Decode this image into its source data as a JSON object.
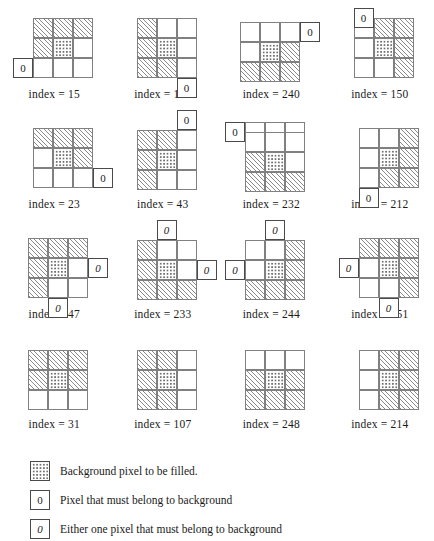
{
  "figure": {
    "rows": 4,
    "cols": 4,
    "cell_size_px": 20,
    "grid_size": 3
  },
  "patterns": [
    {
      "index_label": "index = 15",
      "grid_left": 33,
      "grid_top": 18,
      "hatch": [
        [
          1,
          1,
          1
        ],
        [
          1,
          0,
          0
        ],
        [
          0,
          0,
          0
        ]
      ],
      "dots": [
        [
          0,
          0,
          0
        ],
        [
          0,
          1,
          0
        ],
        [
          0,
          0,
          0
        ]
      ],
      "zeros": [
        {
          "left": 13,
          "top": 58,
          "text": "0",
          "italic": false
        }
      ],
      "extra_cells": [
        {
          "left": 13,
          "top": 58
        },
        {
          "left": 33,
          "top": 58
        },
        {
          "left": 53,
          "top": 58
        },
        {
          "left": 73,
          "top": 58
        }
      ]
    },
    {
      "index_label": "index = 105",
      "grid_left": 28,
      "grid_top": 18,
      "hatch": [
        [
          1,
          0,
          0
        ],
        [
          1,
          0,
          0
        ],
        [
          1,
          1,
          0
        ]
      ],
      "dots": [
        [
          0,
          0,
          0
        ],
        [
          0,
          1,
          0
        ],
        [
          0,
          0,
          0
        ]
      ],
      "zeros": [
        {
          "left": 68,
          "top": 78,
          "text": "0",
          "italic": false
        }
      ],
      "extra_cells": [
        {
          "left": 68,
          "top": 78
        },
        {
          "left": 68,
          "top": 58
        }
      ]
    },
    {
      "index_label": "index = 240",
      "grid_left": 23,
      "grid_top": 22,
      "hatch": [
        [
          0,
          0,
          0
        ],
        [
          0,
          0,
          1
        ],
        [
          1,
          1,
          1
        ]
      ],
      "dots": [
        [
          0,
          0,
          0
        ],
        [
          0,
          1,
          0
        ],
        [
          0,
          0,
          0
        ]
      ],
      "zeros": [
        {
          "left": 83,
          "top": 22,
          "text": "0",
          "italic": false
        }
      ],
      "extra_cells": [
        {
          "left": 83,
          "top": 22
        }
      ]
    },
    {
      "index_label": "index = 150",
      "grid_left": 28,
      "grid_top": 18,
      "hatch": [
        [
          0,
          1,
          1
        ],
        [
          0,
          0,
          1
        ],
        [
          0,
          0,
          1
        ]
      ],
      "dots": [
        [
          0,
          0,
          0
        ],
        [
          0,
          1,
          0
        ],
        [
          0,
          0,
          0
        ]
      ],
      "zeros": [
        {
          "left": 28,
          "top": 8,
          "text": "0",
          "italic": false
        }
      ],
      "extra_cells": [
        {
          "left": 28,
          "top": 8
        }
      ]
    },
    {
      "index_label": "index = 23",
      "grid_left": 33,
      "grid_top": 18,
      "hatch": [
        [
          1,
          1,
          1
        ],
        [
          0,
          0,
          1
        ],
        [
          0,
          0,
          0
        ]
      ],
      "dots": [
        [
          0,
          0,
          0
        ],
        [
          0,
          1,
          0
        ],
        [
          0,
          0,
          0
        ]
      ],
      "zeros": [
        {
          "left": 93,
          "top": 58,
          "text": "0",
          "italic": false
        }
      ],
      "extra_cells": [
        {
          "left": 93,
          "top": 58
        }
      ]
    },
    {
      "index_label": "index = 43",
      "grid_left": 28,
      "grid_top": 20,
      "hatch": [
        [
          1,
          1,
          0
        ],
        [
          1,
          0,
          0
        ],
        [
          1,
          0,
          0
        ]
      ],
      "dots": [
        [
          0,
          0,
          0
        ],
        [
          0,
          1,
          0
        ],
        [
          0,
          0,
          0
        ]
      ],
      "zeros": [
        {
          "left": 68,
          "top": 0,
          "text": "0",
          "italic": false
        }
      ],
      "extra_cells": [
        {
          "left": 68,
          "top": 0
        }
      ]
    },
    {
      "index_label": "index = 232",
      "grid_left": 28,
      "grid_top": 22,
      "hatch": [
        [
          0,
          0,
          0
        ],
        [
          1,
          0,
          0
        ],
        [
          1,
          1,
          1
        ]
      ],
      "dots": [
        [
          0,
          0,
          0
        ],
        [
          0,
          1,
          0
        ],
        [
          0,
          0,
          0
        ]
      ],
      "zeros": [
        {
          "left": 8,
          "top": 12,
          "text": "0",
          "italic": false
        }
      ],
      "extra_cells": [
        {
          "left": 8,
          "top": 12
        },
        {
          "left": 28,
          "top": 12
        },
        {
          "left": 48,
          "top": 12
        },
        {
          "left": 68,
          "top": 12
        }
      ]
    },
    {
      "index_label": "index = 212",
      "grid_left": 33,
      "grid_top": 18,
      "hatch": [
        [
          0,
          0,
          1
        ],
        [
          0,
          0,
          1
        ],
        [
          0,
          1,
          1
        ]
      ],
      "dots": [
        [
          0,
          0,
          0
        ],
        [
          0,
          1,
          0
        ],
        [
          0,
          0,
          0
        ]
      ],
      "zeros": [
        {
          "left": 33,
          "top": 78,
          "text": "0",
          "italic": false
        }
      ],
      "extra_cells": [
        {
          "left": 33,
          "top": 78
        }
      ]
    },
    {
      "index_label": "index = 47",
      "grid_left": 28,
      "grid_top": 18,
      "hatch": [
        [
          1,
          1,
          1
        ],
        [
          1,
          0,
          0
        ],
        [
          1,
          0,
          0
        ]
      ],
      "dots": [
        [
          0,
          0,
          0
        ],
        [
          0,
          1,
          0
        ],
        [
          0,
          0,
          0
        ]
      ],
      "zeros": [
        {
          "left": 88,
          "top": 38,
          "text": "0",
          "italic": true
        },
        {
          "left": 48,
          "top": 78,
          "text": "0",
          "italic": true
        }
      ],
      "extra_cells": [
        {
          "left": 88,
          "top": 38
        },
        {
          "left": 48,
          "top": 78
        }
      ]
    },
    {
      "index_label": "index = 233",
      "grid_left": 28,
      "grid_top": 20,
      "hatch": [
        [
          1,
          0,
          0
        ],
        [
          1,
          0,
          0
        ],
        [
          1,
          1,
          1
        ]
      ],
      "dots": [
        [
          0,
          0,
          0
        ],
        [
          0,
          1,
          0
        ],
        [
          0,
          0,
          0
        ]
      ],
      "zeros": [
        {
          "left": 48,
          "top": 0,
          "text": "0",
          "italic": true
        },
        {
          "left": 88,
          "top": 40,
          "text": "0",
          "italic": true
        }
      ],
      "extra_cells": [
        {
          "left": 48,
          "top": 0
        },
        {
          "left": 88,
          "top": 40
        }
      ]
    },
    {
      "index_label": "index = 244",
      "grid_left": 28,
      "grid_top": 20,
      "hatch": [
        [
          0,
          0,
          1
        ],
        [
          0,
          0,
          1
        ],
        [
          1,
          1,
          1
        ]
      ],
      "dots": [
        [
          0,
          0,
          0
        ],
        [
          0,
          1,
          0
        ],
        [
          0,
          0,
          0
        ]
      ],
      "zeros": [
        {
          "left": 48,
          "top": 0,
          "text": "0",
          "italic": true
        },
        {
          "left": 8,
          "top": 40,
          "text": "0",
          "italic": true
        }
      ],
      "extra_cells": [
        {
          "left": 48,
          "top": 0
        },
        {
          "left": 8,
          "top": 40
        }
      ]
    },
    {
      "index_label": "index = 151",
      "grid_left": 33,
      "grid_top": 18,
      "hatch": [
        [
          1,
          1,
          1
        ],
        [
          0,
          0,
          1
        ],
        [
          0,
          0,
          1
        ]
      ],
      "dots": [
        [
          0,
          0,
          0
        ],
        [
          0,
          1,
          0
        ],
        [
          0,
          0,
          0
        ]
      ],
      "zeros": [
        {
          "left": 13,
          "top": 38,
          "text": "0",
          "italic": true
        },
        {
          "left": 53,
          "top": 78,
          "text": "0",
          "italic": true
        }
      ],
      "extra_cells": [
        {
          "left": 13,
          "top": 38
        },
        {
          "left": 53,
          "top": 78
        }
      ]
    },
    {
      "index_label": "index = 31",
      "grid_left": 28,
      "grid_top": 20,
      "hatch": [
        [
          1,
          1,
          1
        ],
        [
          1,
          0,
          1
        ],
        [
          0,
          0,
          0
        ]
      ],
      "dots": [
        [
          0,
          0,
          0
        ],
        [
          0,
          1,
          0
        ],
        [
          0,
          0,
          0
        ]
      ],
      "zeros": [],
      "extra_cells": []
    },
    {
      "index_label": "index = 107",
      "grid_left": 28,
      "grid_top": 20,
      "hatch": [
        [
          1,
          1,
          0
        ],
        [
          1,
          0,
          0
        ],
        [
          1,
          1,
          0
        ]
      ],
      "dots": [
        [
          0,
          0,
          0
        ],
        [
          0,
          1,
          0
        ],
        [
          0,
          0,
          0
        ]
      ],
      "zeros": [],
      "extra_cells": []
    },
    {
      "index_label": "index = 248",
      "grid_left": 28,
      "grid_top": 20,
      "hatch": [
        [
          0,
          0,
          0
        ],
        [
          1,
          0,
          1
        ],
        [
          1,
          1,
          1
        ]
      ],
      "dots": [
        [
          0,
          0,
          0
        ],
        [
          0,
          1,
          0
        ],
        [
          0,
          0,
          0
        ]
      ],
      "zeros": [],
      "extra_cells": []
    },
    {
      "index_label": "index = 214",
      "grid_left": 33,
      "grid_top": 20,
      "hatch": [
        [
          0,
          1,
          1
        ],
        [
          0,
          0,
          1
        ],
        [
          0,
          1,
          1
        ]
      ],
      "dots": [
        [
          0,
          0,
          0
        ],
        [
          0,
          1,
          0
        ],
        [
          0,
          0,
          0
        ]
      ],
      "zeros": [],
      "extra_cells": []
    }
  ],
  "legend": [
    {
      "swatch": "dots",
      "zero_text": "",
      "italic": false,
      "text": "Background pixel to be filled."
    },
    {
      "swatch": "zero",
      "zero_text": "0",
      "italic": false,
      "text": "Pixel that must belong to background"
    },
    {
      "swatch": "zero-ital",
      "zero_text": "0",
      "italic": true,
      "text": "Either one pixel that must belong to background"
    }
  ]
}
